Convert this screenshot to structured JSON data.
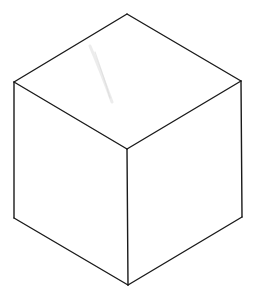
{
  "diagram": {
    "type": "isometric-cube-line-drawing",
    "background": "#ffffff",
    "stroke_color": "#1a1a1a",
    "vertices": {
      "top": [
        127,
        14
      ],
      "upper_left": [
        14,
        82
      ],
      "upper_right": [
        241,
        81
      ],
      "center": [
        127,
        149
      ],
      "lower_left": [
        14,
        218
      ],
      "lower_right": [
        242,
        217
      ],
      "bottom": [
        128,
        285
      ]
    },
    "faces": [
      {
        "name": "top-face",
        "points": "127,14 241,81 127,149 14,82"
      },
      {
        "name": "left-face",
        "points": "14,82 127,149 128,285 14,218"
      },
      {
        "name": "right-face",
        "points": "127,149 241,81 242,217 128,285"
      }
    ],
    "edges": [
      {
        "name": "edge-top-upper-left",
        "x1": 127,
        "y1": 14,
        "x2": 14,
        "y2": 82
      },
      {
        "name": "edge-top-upper-right",
        "x1": 127,
        "y1": 14,
        "x2": 241,
        "y2": 81
      },
      {
        "name": "edge-upper-left-center",
        "x1": 14,
        "y1": 82,
        "x2": 127,
        "y2": 149
      },
      {
        "name": "edge-upper-right-center",
        "x1": 241,
        "y1": 81,
        "x2": 127,
        "y2": 149
      },
      {
        "name": "edge-center-bottom",
        "x1": 127,
        "y1": 149,
        "x2": 128,
        "y2": 285
      },
      {
        "name": "edge-left-vertical",
        "x1": 14,
        "y1": 82,
        "x2": 14,
        "y2": 218
      },
      {
        "name": "edge-right-vertical",
        "x1": 241,
        "y1": 81,
        "x2": 242,
        "y2": 217
      },
      {
        "name": "edge-lower-left-bottom",
        "x1": 14,
        "y1": 218,
        "x2": 128,
        "y2": 285
      },
      {
        "name": "edge-lower-right-bottom",
        "x1": 242,
        "y1": 217,
        "x2": 128,
        "y2": 285
      }
    ],
    "marks": [
      {
        "name": "pencil-smudge",
        "color": "#e4e4e4",
        "path": "M90,46 C96,60 104,80 112,102"
      }
    ]
  }
}
